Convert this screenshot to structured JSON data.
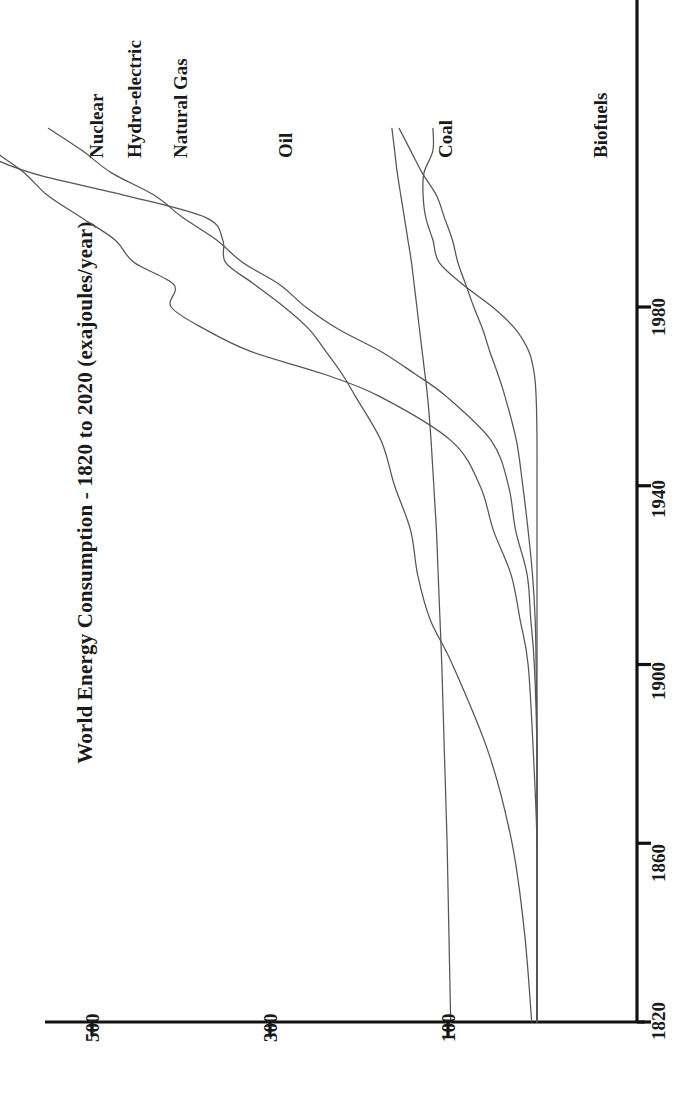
{
  "chart_data": {
    "type": "line",
    "title": "World Energy Consumption - 1820 to 2020 (exajoules/year)",
    "xlabel": "",
    "ylabel": "exajoules/year",
    "orientation": "rotated-90-ccw",
    "grid": false,
    "legend_position": "inline-end-of-line",
    "xlim": [
      1820,
      2020
    ],
    "ylim": [
      0,
      600
    ],
    "x_ticks": [
      "1820",
      "1860",
      "1900",
      "1940",
      "1980"
    ],
    "y_ticks": [
      "100",
      "300",
      "500"
    ],
    "x": [
      1820,
      1840,
      1860,
      1880,
      1900,
      1910,
      1920,
      1930,
      1940,
      1950,
      1960,
      1965,
      1970,
      1975,
      1980,
      1985,
      1990,
      1995,
      2000,
      2005,
      2010,
      2015,
      2020
    ],
    "series": [
      {
        "name": "Biofuels",
        "values": [
          97,
          99,
          101,
          104,
          107,
          109,
          111,
          113,
          116,
          119,
          123,
          126,
          129,
          132,
          135,
          138,
          141,
          145,
          149,
          153,
          157,
          160,
          163
        ]
      },
      {
        "name": "Coal",
        "values": [
          6,
          14,
          28,
          54,
          95,
          120,
          134,
          142,
          160,
          175,
          204,
          219,
          237,
          256,
          284,
          317,
          350,
          353,
          372,
          463,
          568,
          625,
          632
        ]
      },
      {
        "name": "Oil",
        "values": [
          0,
          0,
          0,
          4,
          10,
          19,
          29,
          49,
          64,
          96,
          177,
          240,
          321,
          373,
          411,
          408,
          453,
          474,
          512,
          550,
          576,
          610,
          636
        ]
      },
      {
        "name": "Natural Gas",
        "values": [
          0,
          0,
          0,
          0,
          3,
          7,
          11,
          24,
          32,
          51,
          102,
          137,
          175,
          223,
          260,
          289,
          331,
          360,
          398,
          430,
          478,
          511,
          549
        ]
      },
      {
        "name": "Hydro-electric",
        "values": [
          0,
          0,
          0,
          0,
          1,
          2,
          5,
          10,
          16,
          23,
          36,
          44,
          53,
          61,
          71,
          80,
          89,
          95,
          104,
          113,
          129,
          142,
          155
        ]
      },
      {
        "name": "Nuclear",
        "values": [
          0,
          0,
          0,
          0,
          0,
          0,
          0,
          0,
          0,
          0,
          1,
          3,
          9,
          24,
          50,
          83,
          110,
          117,
          125,
          128,
          127,
          117,
          117
        ]
      }
    ]
  },
  "labels": {
    "nuclear": "Nuclear",
    "hydro": "Hydro-electric",
    "natural_gas": "Natural Gas",
    "oil": "Oil",
    "coal": "Coal",
    "biofuels": "Biofuels"
  },
  "axis": {
    "x_tick_1820": "1820",
    "x_tick_1860": "1860",
    "x_tick_1900": "1900",
    "x_tick_1940": "1940",
    "x_tick_1980": "1980",
    "y_tick_100": "100",
    "y_tick_300": "300",
    "y_tick_500": "500"
  },
  "colors": {
    "line": "#555555",
    "axis": "#111111",
    "text": "#1a1a1a",
    "background": "#ffffff"
  }
}
